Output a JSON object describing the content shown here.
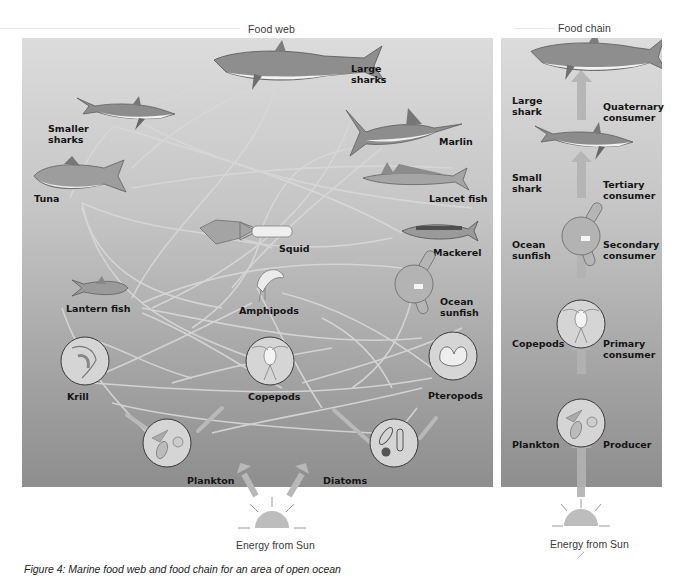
{
  "food_web": {
    "title": "Food web",
    "organisms": [
      {
        "id": "large-sharks",
        "label": "Large\nsharks"
      },
      {
        "id": "smaller-sharks",
        "label": "Smaller\nsharks"
      },
      {
        "id": "marlin",
        "label": "Marlin"
      },
      {
        "id": "tuna",
        "label": "Tuna"
      },
      {
        "id": "lancet-fish",
        "label": "Lancet fish"
      },
      {
        "id": "squid",
        "label": "Squid"
      },
      {
        "id": "mackerel",
        "label": "Mackerel"
      },
      {
        "id": "lantern-fish",
        "label": "Lantern fish"
      },
      {
        "id": "amphipods",
        "label": "Amphipods"
      },
      {
        "id": "ocean-sunfish",
        "label": "Ocean\nsunfish"
      },
      {
        "id": "krill",
        "label": "Krill"
      },
      {
        "id": "copepods",
        "label": "Copepods"
      },
      {
        "id": "pteropods",
        "label": "Pteropods"
      },
      {
        "id": "plankton",
        "label": "Plankton"
      },
      {
        "id": "diatoms",
        "label": "Diatoms"
      }
    ],
    "energy_source": "Energy from Sun"
  },
  "food_chain": {
    "title": "Food chain",
    "levels": [
      {
        "organism": "Large\nshark",
        "role": "Quaternary\nconsumer"
      },
      {
        "organism": "Small\nshark",
        "role": "Tertiary\nconsumer"
      },
      {
        "organism": "Ocean\nsunfish",
        "role": "Secondary\nconsumer"
      },
      {
        "organism": "Copepods",
        "role": "Primary\nconsumer"
      },
      {
        "organism": "Plankton",
        "role": "Producer"
      }
    ],
    "energy_source": "Energy from Sun"
  },
  "caption": "Figure 4: Marine food web and food chain for an area of open ocean",
  "colors": {
    "panel_top": "#dcdcdc",
    "panel_bottom": "#8e8e8e",
    "link_line": "#d6d6d6",
    "arrow": "#b8b8b8",
    "label_text": "#151515"
  }
}
